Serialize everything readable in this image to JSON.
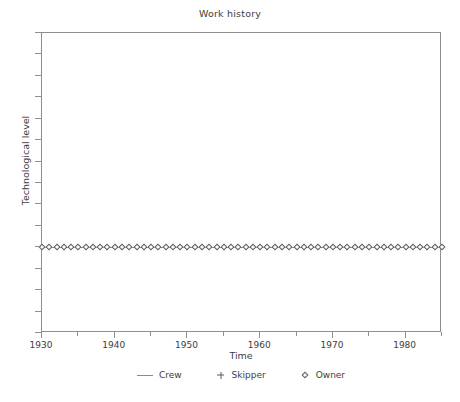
{
  "chart_data": {
    "type": "line",
    "title": "Work history",
    "xlabel": "Time",
    "ylabel": "Technological level",
    "xlim": [
      1930,
      1985
    ],
    "ylim": [
      0,
      14
    ],
    "grid": false,
    "legend_position": "bottom-center",
    "x_major_ticks": [
      1930,
      1940,
      1950,
      1960,
      1970,
      1980
    ],
    "x_major_tick_labels": [
      "1930",
      "1940",
      "1950",
      "1960",
      "1970",
      "1980"
    ],
    "x_minor_ticks": [
      1935,
      1945,
      1955,
      1965,
      1975,
      1985
    ],
    "y_major_ticks": [
      0,
      1,
      2,
      3,
      4,
      5,
      6,
      7,
      8,
      9,
      10,
      11,
      12,
      13,
      14
    ],
    "y_tick_labels": [],
    "series": [
      {
        "name": "Crew",
        "marker": "line",
        "color": "#7a7a7a",
        "x": [
          1930,
          1985
        ],
        "values": [
          4,
          4
        ]
      },
      {
        "name": "Skipper",
        "marker": "plus",
        "color": "#5c5c5c",
        "x": [],
        "values": []
      },
      {
        "name": "Owner",
        "marker": "diamond",
        "color": "#5c5c5c",
        "x": [
          1930,
          1931,
          1932,
          1933,
          1934,
          1935,
          1936,
          1937,
          1938,
          1939,
          1940,
          1941,
          1942,
          1943,
          1944,
          1945,
          1946,
          1947,
          1948,
          1949,
          1950,
          1951,
          1952,
          1953,
          1954,
          1955,
          1956,
          1957,
          1958,
          1959,
          1960,
          1961,
          1962,
          1963,
          1964,
          1965,
          1966,
          1967,
          1968,
          1969,
          1970,
          1971,
          1972,
          1973,
          1974,
          1975,
          1976,
          1977,
          1978,
          1979,
          1980,
          1981,
          1982,
          1983,
          1984,
          1985
        ],
        "values": [
          4,
          4,
          4,
          4,
          4,
          4,
          4,
          4,
          4,
          4,
          4,
          4,
          4,
          4,
          4,
          4,
          4,
          4,
          4,
          4,
          4,
          4,
          4,
          4,
          4,
          4,
          4,
          4,
          4,
          4,
          4,
          4,
          4,
          4,
          4,
          4,
          4,
          4,
          4,
          4,
          4,
          4,
          4,
          4,
          4,
          4,
          4,
          4,
          4,
          4,
          4,
          4,
          4,
          4,
          4,
          4
        ]
      }
    ],
    "legend": [
      {
        "label": "Crew",
        "marker": "line"
      },
      {
        "label": "Skipper",
        "marker": "plus"
      },
      {
        "label": "Owner",
        "marker": "diamond"
      }
    ]
  }
}
